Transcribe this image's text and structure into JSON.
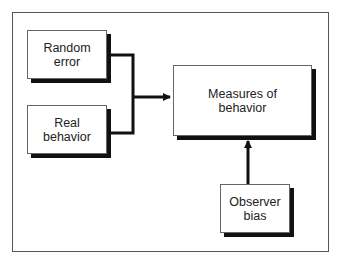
{
  "diagram": {
    "type": "flow",
    "nodes": [
      {
        "id": "random_error",
        "lines": [
          "Random",
          "error"
        ]
      },
      {
        "id": "real_behavior",
        "lines": [
          "Real",
          "behavior"
        ]
      },
      {
        "id": "measures",
        "lines": [
          "Measures of",
          "behavior"
        ]
      },
      {
        "id": "observer_bias",
        "lines": [
          "Observer",
          "bias"
        ]
      }
    ],
    "edges": [
      {
        "from": "random_error",
        "to": "measures"
      },
      {
        "from": "real_behavior",
        "to": "measures"
      },
      {
        "from": "observer_bias",
        "to": "measures"
      }
    ]
  }
}
